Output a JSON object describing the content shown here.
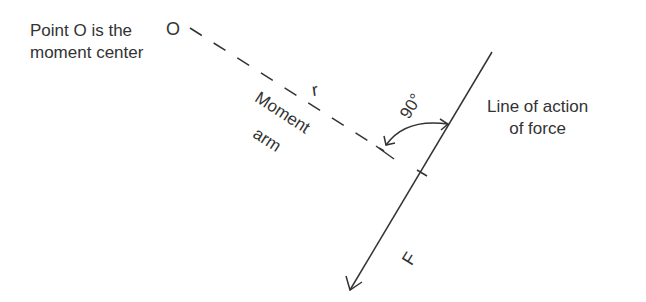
{
  "labels": {
    "point_o_line1": "Point O is the",
    "point_o_line2": "moment center",
    "point_symbol": "O",
    "r_symbol": "r",
    "moment_arm_line1": "Moment",
    "moment_arm_line2": "arm",
    "angle": "90°",
    "line_of_action_line1": "Line of action",
    "line_of_action_line2": "of force",
    "force_symbol": "F"
  },
  "colors": {
    "stroke": "#333333",
    "background": "#ffffff"
  }
}
